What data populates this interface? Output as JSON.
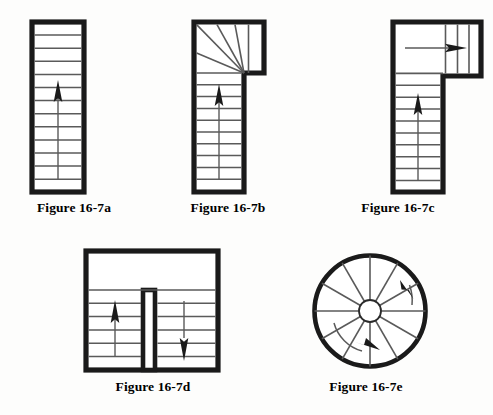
{
  "page": {
    "background_color": "#fdfdfc",
    "ink_color": "#000000",
    "line_color": "#555555"
  },
  "figures": [
    {
      "id": "a",
      "caption": "Figure 16-7a",
      "type": "straight-run-stair",
      "description": "Straight run stair with uniform treads and single up arrow",
      "tread_count": 13,
      "arrow_direction": "up",
      "arrow_label": "UP"
    },
    {
      "id": "b",
      "caption": "Figure 16-7b",
      "type": "winder-stair",
      "description": "Straight run with winder treads radiating at top landing",
      "straight_tread_count": 10,
      "winder_tread_count": 5,
      "arrow_direction": "up",
      "arrow_label": "UP"
    },
    {
      "id": "c",
      "caption": "Figure 16-7c",
      "type": "l-shaped-stair",
      "description": "L-shaped stair with landing and perpendicular upper run",
      "straight_tread_count": 10,
      "upper_run_tread_count": 3,
      "arrow_direction": "up-then-right",
      "arrow_label": "UP"
    },
    {
      "id": "d",
      "caption": "Figure 16-7d",
      "type": "u-shaped-stair",
      "description": "U-shaped double return stair with central wall and landing",
      "left_run_tread_count": 6,
      "right_run_tread_count": 6,
      "arrow_direction_left": "up",
      "arrow_direction_right": "down",
      "arrow_label": "UP"
    },
    {
      "id": "e",
      "caption": "Figure 16-7e",
      "type": "spiral-stair",
      "description": "Circular spiral stair with radiating wedge treads around center post",
      "tread_count": 12,
      "arrow_direction": "clockwise",
      "arrow_label": "UP"
    }
  ]
}
